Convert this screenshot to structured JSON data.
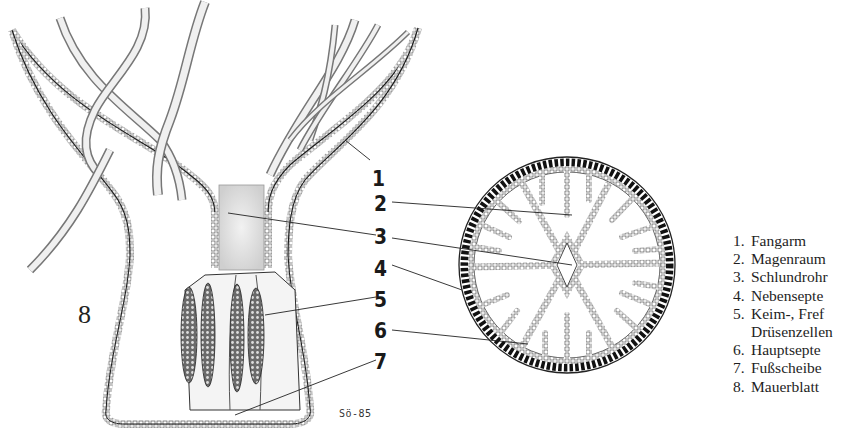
{
  "figure": {
    "type": "anatomical diagram",
    "views": [
      "longitudinal-section",
      "cross-section"
    ],
    "signature": "Sö-85",
    "side_label": "8"
  },
  "callouts": [
    {
      "number": "1"
    },
    {
      "number": "2"
    },
    {
      "number": "3"
    },
    {
      "number": "4"
    },
    {
      "number": "5"
    },
    {
      "number": "6"
    },
    {
      "number": "7"
    }
  ],
  "legend": {
    "items": [
      {
        "number": "1.",
        "label": "Fangarm"
      },
      {
        "number": "2.",
        "label": "Magenraum"
      },
      {
        "number": "3.",
        "label": "Schlundrohr"
      },
      {
        "number": "4.",
        "label": "Nebensepte"
      },
      {
        "number": "5.",
        "label": "Keim-, Fref",
        "continuation": "Drüsenzellen"
      },
      {
        "number": "6.",
        "label": "Hauptsepte"
      },
      {
        "number": "7.",
        "label": "Fußscheibe"
      },
      {
        "number": "8.",
        "label": "Mauerblatt"
      }
    ]
  },
  "colors": {
    "ink": "#1a1a1a",
    "background": "#ffffff",
    "stipple": "#d9d9d9",
    "ectoderm_dark": "#111111"
  }
}
